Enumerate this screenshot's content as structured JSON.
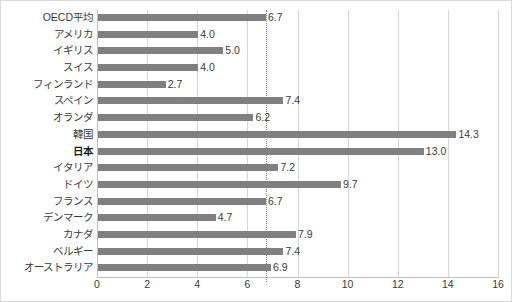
{
  "chart_data": {
    "type": "bar",
    "orientation": "horizontal",
    "title": "",
    "xlabel": "",
    "ylabel": "",
    "xlim": [
      0,
      16
    ],
    "xticks": [
      0,
      2,
      4,
      6,
      8,
      10,
      12,
      14,
      16
    ],
    "grid": true,
    "legend": false,
    "bar_color": "#808080",
    "reference_line": {
      "value": 6.7,
      "style": "dotted",
      "color": "#808080",
      "label": "OECD平均"
    },
    "highlight_category": "日本",
    "categories": [
      "OECD平均",
      "アメリカ",
      "イギリス",
      "スイス",
      "フィンランド",
      "スペイン",
      "オランダ",
      "韓国",
      "日本",
      "イタリア",
      "ドイツ",
      "フランス",
      "デンマーク",
      "カナダ",
      "ベルギー",
      "オーストラリア"
    ],
    "values": [
      6.7,
      4.0,
      5.0,
      4.0,
      2.7,
      7.4,
      6.2,
      14.3,
      13.0,
      7.2,
      9.7,
      6.7,
      4.7,
      7.9,
      7.4,
      6.9
    ],
    "value_labels": [
      "6.7",
      "4.0",
      "5.0",
      "4.0",
      "2.7",
      "7.4",
      "6.2",
      "14.3",
      "13.0",
      "7.2",
      "9.7",
      "6.7",
      "4.7",
      "7.9",
      "7.4",
      "6.9"
    ]
  }
}
